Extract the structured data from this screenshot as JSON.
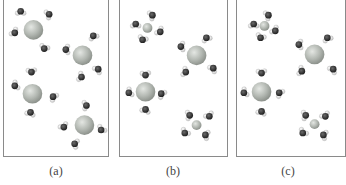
{
  "figure": {
    "panels": [
      {
        "id": "a",
        "label": "(a)",
        "description": "Ions with loosely scattered water molecules",
        "ions": [
          {
            "x": 30,
            "y": 30,
            "r": 10,
            "color": "#b9bdb8"
          },
          {
            "x": 80,
            "y": 56,
            "r": 10,
            "color": "#b9bdb8"
          },
          {
            "x": 29,
            "y": 95,
            "r": 10,
            "color": "#b9bdb8"
          },
          {
            "x": 82,
            "y": 127,
            "r": 10,
            "color": "#b9bdb8"
          }
        ],
        "waters": [
          {
            "x": 17,
            "y": 11
          },
          {
            "x": 46,
            "y": 14
          },
          {
            "x": 11,
            "y": 33
          },
          {
            "x": 41,
            "y": 49
          },
          {
            "x": 63,
            "y": 50
          },
          {
            "x": 91,
            "y": 36
          },
          {
            "x": 96,
            "y": 70
          },
          {
            "x": 79,
            "y": 78
          },
          {
            "x": 28,
            "y": 73
          },
          {
            "x": 11,
            "y": 87
          },
          {
            "x": 50,
            "y": 98
          },
          {
            "x": 27,
            "y": 114
          },
          {
            "x": 84,
            "y": 107
          },
          {
            "x": 61,
            "y": 129
          },
          {
            "x": 99,
            "y": 132
          },
          {
            "x": 72,
            "y": 146
          }
        ]
      },
      {
        "id": "b",
        "label": "(b)",
        "description": "Ions each surrounded by four oriented water molecules",
        "ions": [
          {
            "x": 28,
            "y": 28,
            "r": 5,
            "color": "#bcc2bc"
          },
          {
            "x": 78,
            "y": 56,
            "r": 10,
            "color": "#b9bdb8"
          },
          {
            "x": 26,
            "y": 93,
            "r": 10,
            "color": "#b9bdb8"
          },
          {
            "x": 78,
            "y": 127,
            "r": 5,
            "color": "#bcc2bc"
          }
        ],
        "waters": [
          {
            "x": 16,
            "y": 24
          },
          {
            "x": 33,
            "y": 15
          },
          {
            "x": 41,
            "y": 32
          },
          {
            "x": 23,
            "y": 40
          },
          {
            "x": 62,
            "y": 47
          },
          {
            "x": 88,
            "y": 38
          },
          {
            "x": 95,
            "y": 69
          },
          {
            "x": 67,
            "y": 73
          },
          {
            "x": 26,
            "y": 76
          },
          {
            "x": 9,
            "y": 94
          },
          {
            "x": 42,
            "y": 95
          },
          {
            "x": 26,
            "y": 111
          },
          {
            "x": 71,
            "y": 117
          },
          {
            "x": 91,
            "y": 118
          },
          {
            "x": 66,
            "y": 135
          },
          {
            "x": 87,
            "y": 137
          }
        ]
      },
      {
        "id": "c",
        "label": "(c)",
        "description": "Ions surrounded by water molecules with reversed orientation",
        "ions": [
          {
            "x": 28,
            "y": 26,
            "r": 5,
            "color": "#bcc2bc"
          },
          {
            "x": 79,
            "y": 55,
            "r": 10,
            "color": "#b9bdb8"
          },
          {
            "x": 25,
            "y": 93,
            "r": 10,
            "color": "#b9bdb8"
          },
          {
            "x": 79,
            "y": 126,
            "r": 5,
            "color": "#bcc2bc"
          }
        ],
        "waters": [
          {
            "x": 17,
            "y": 24
          },
          {
            "x": 32,
            "y": 15
          },
          {
            "x": 39,
            "y": 31
          },
          {
            "x": 24,
            "y": 38
          },
          {
            "x": 63,
            "y": 45
          },
          {
            "x": 92,
            "y": 38
          },
          {
            "x": 98,
            "y": 70
          },
          {
            "x": 66,
            "y": 72
          },
          {
            "x": 25,
            "y": 74
          },
          {
            "x": 7,
            "y": 94
          },
          {
            "x": 43,
            "y": 94
          },
          {
            "x": 25,
            "y": 113
          },
          {
            "x": 70,
            "y": 117
          },
          {
            "x": 90,
            "y": 118
          },
          {
            "x": 67,
            "y": 135
          },
          {
            "x": 88,
            "y": 137
          }
        ]
      }
    ],
    "colors": {
      "frame": "#8a8a8a",
      "ion": "#b9bdb8",
      "oxygen": "#3a3a3a",
      "hydrogen": "#e6e6e6",
      "label": "#444444"
    }
  }
}
